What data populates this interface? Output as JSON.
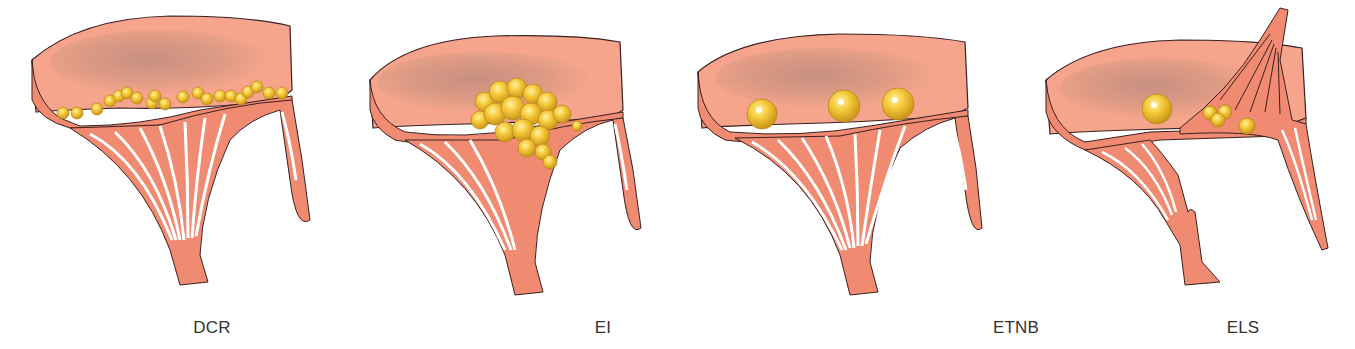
{
  "figure": {
    "colors": {
      "tissue": "#f08a70",
      "tissue_light": "#f6a58c",
      "tissue_shadow": "#c98a7a",
      "outline": "#3a2020",
      "deposit": "#f2c230",
      "deposit_edge": "#c9951a",
      "label_text": "#333333"
    },
    "panels": [
      {
        "id": "dcr",
        "label": "DCR",
        "label_x": 212,
        "deposit_pattern": "many small uniform nodules along the closure line"
      },
      {
        "id": "ei",
        "label": "EI",
        "label_x": 603,
        "deposit_pattern": "large irregular cluster of vegetations"
      },
      {
        "id": "etnb",
        "label": "ETNB",
        "label_x": 1016,
        "deposit_pattern": "three medium rounded masses along the closure line"
      },
      {
        "id": "els",
        "label": "ELS",
        "label_x": 1243,
        "deposit_pattern": "one medium mass and a few small nodules; ruptured chordae"
      }
    ]
  }
}
